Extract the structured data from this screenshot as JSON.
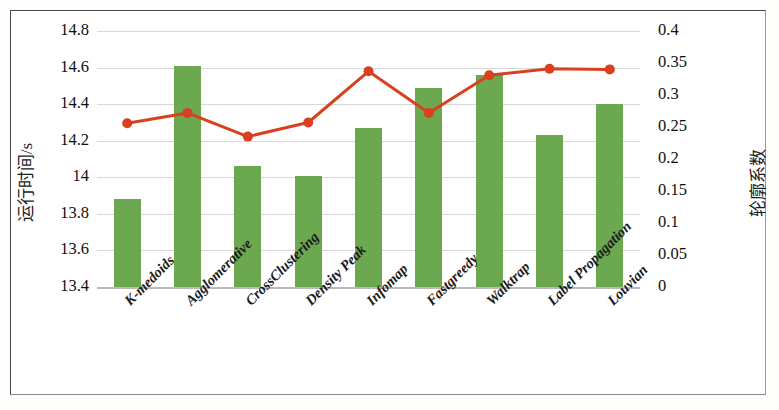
{
  "chart_data": {
    "type": "bar",
    "title": "",
    "subtitle": "",
    "categories": [
      "K-medoids",
      "Agglomerative",
      "CrossClustering",
      "Density Peak",
      "Infomap",
      "Fastgreedy",
      "Walktrap",
      "Label Propagation",
      "Louvian"
    ],
    "series": [
      {
        "name": "运行时间/s",
        "type": "bar",
        "axis": "left",
        "color": "#6ca84f",
        "values": [
          13.88,
          14.61,
          14.06,
          14.01,
          14.27,
          14.49,
          14.56,
          14.23,
          14.4
        ]
      },
      {
        "name": "轮廓系数",
        "type": "line",
        "axis": "right",
        "color": "#d9401f",
        "marker": "circle",
        "values": [
          0.256,
          0.272,
          0.235,
          0.257,
          0.337,
          0.272,
          0.331,
          0.341,
          0.34
        ]
      }
    ],
    "xlabel": "",
    "ylabel": "运行时间/s",
    "y2label": "轮廓系数",
    "ylim": [
      13.4,
      14.8
    ],
    "y2lim": [
      0,
      0.4
    ],
    "yticks": [
      "13.4",
      "13.6",
      "13.8",
      "14",
      "14.2",
      "14.4",
      "14.6",
      "14.8"
    ],
    "ytick_values": [
      13.4,
      13.6,
      13.8,
      14.0,
      14.2,
      14.4,
      14.6,
      14.8
    ],
    "y2ticks": [
      "0",
      "0.05",
      "0.1",
      "0.15",
      "0.2",
      "0.25",
      "0.3",
      "0.35",
      "0.4"
    ],
    "y2tick_values": [
      0,
      0.05,
      0.1,
      0.15,
      0.2,
      0.25,
      0.3,
      0.35,
      0.4
    ],
    "grid": true,
    "grid_axis": "y",
    "legend": "none",
    "xtick_rotation": -45
  },
  "axes": {
    "left_title": "运行时间/s",
    "right_title": "轮廓系数"
  },
  "colors": {
    "bar": "#6ca84f",
    "line": "#d9401f",
    "grid": "#d8d8d8",
    "frame": "#4a4a4a",
    "background": "#ffffff"
  }
}
